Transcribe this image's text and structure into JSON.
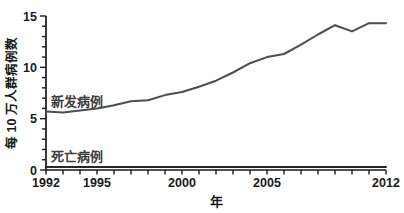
{
  "chart_data": {
    "type": "line",
    "title": "",
    "xlabel": "年",
    "ylabel": "每 10 万人群病例数",
    "x": [
      1992,
      1993,
      1994,
      1995,
      1996,
      1997,
      1998,
      1999,
      2000,
      2001,
      2002,
      2003,
      2004,
      2005,
      2006,
      2007,
      2008,
      2009,
      2010,
      2011,
      2012
    ],
    "xlim": [
      1992,
      2012
    ],
    "ylim": [
      0,
      15
    ],
    "x_labeled_ticks": [
      1992,
      1995,
      2000,
      2005,
      2012
    ],
    "x_minor_tick_step": 1,
    "y_major_ticks": [
      0,
      5,
      10,
      15
    ],
    "y_minor_tick_step": 1,
    "grid": false,
    "legend": "inline-text-labels",
    "series": [
      {
        "id": "new-cases",
        "name": "新发病例",
        "color": "#4d4d4d",
        "values": [
          5.7,
          5.6,
          5.8,
          6.0,
          6.3,
          6.7,
          6.8,
          7.3,
          7.6,
          8.1,
          8.7,
          9.5,
          10.4,
          11.0,
          11.3,
          12.2,
          13.2,
          14.1,
          13.5,
          14.3,
          14.3
        ]
      },
      {
        "id": "deaths",
        "name": "死亡病例",
        "color": "#262626",
        "values": [
          0.3,
          0.3,
          0.3,
          0.3,
          0.3,
          0.3,
          0.3,
          0.3,
          0.3,
          0.3,
          0.3,
          0.3,
          0.3,
          0.3,
          0.3,
          0.3,
          0.3,
          0.3,
          0.3,
          0.3,
          0.3
        ]
      }
    ],
    "colors": {
      "axis": "#1a1a1a",
      "text": "#1a1a1a",
      "background": "#ffffff"
    }
  }
}
